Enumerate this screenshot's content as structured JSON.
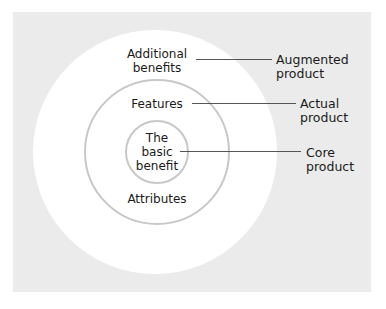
{
  "diagram": {
    "type": "concentric-levels-of-product",
    "rings": [
      {
        "id": "outer",
        "inside_label": "Additional benefits",
        "outside_label": "Augmented product"
      },
      {
        "id": "middle",
        "inside_label_top": "Features",
        "inside_label_bottom": "Attributes",
        "outside_label": "Actual product"
      },
      {
        "id": "inner",
        "inside_label": "The basic benefit",
        "outside_label": "Core product"
      }
    ],
    "labels": {
      "additional_1": "Additional",
      "additional_2": "benefits",
      "features": "Features",
      "the": "The",
      "basic": "basic",
      "benefit": "benefit",
      "attributes": "Attributes",
      "augmented_1": "Augmented",
      "augmented_2": "product",
      "actual_1": "Actual",
      "actual_2": "product",
      "core_1": "Core",
      "core_2": "product"
    },
    "colors": {
      "background_panel": "#ebebeb",
      "outer_fill": "#ffffff",
      "ring_stroke": "#c8c8c8",
      "leader_line": "#555555"
    }
  }
}
